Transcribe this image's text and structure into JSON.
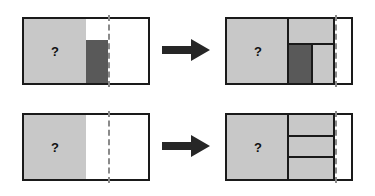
{
  "figure": {
    "background_color": "#ffffff",
    "stroke_color": "#1a1a1a",
    "light_fill": "#c8c8c8",
    "dark_fill": "#595959",
    "dashed_line_color": "#8a8a8a",
    "arrow_color": "#262626",
    "unknown_label": "?",
    "rows": [
      {
        "id": "row-1",
        "left_panel": {
          "id": "panel-top-left",
          "label": "?",
          "blocks": [
            {
              "name": "large-light-block",
              "fill": "light"
            },
            {
              "name": "dark-block",
              "fill": "dark"
            },
            {
              "name": "empty-notch",
              "fill": "white"
            },
            {
              "name": "empty-right-region",
              "fill": "white"
            }
          ],
          "dashed_divider": true
        },
        "arrow": {
          "name": "transform-arrow-top",
          "direction": "right"
        },
        "right_panel": {
          "id": "panel-top-right",
          "label": "?",
          "blocks": [
            {
              "name": "large-light-block",
              "fill": "light"
            },
            {
              "name": "upper-light-block",
              "fill": "light"
            },
            {
              "name": "dark-block",
              "fill": "dark"
            },
            {
              "name": "lower-right-light-block",
              "fill": "light"
            },
            {
              "name": "empty-right-region",
              "fill": "white"
            }
          ],
          "dashed_divider": true
        }
      },
      {
        "id": "row-2",
        "left_panel": {
          "id": "panel-bottom-left",
          "label": "?",
          "blocks": [
            {
              "name": "large-light-block",
              "fill": "light"
            },
            {
              "name": "empty-right-region",
              "fill": "white"
            }
          ],
          "dashed_divider": true
        },
        "arrow": {
          "name": "transform-arrow-bottom",
          "direction": "right"
        },
        "right_panel": {
          "id": "panel-bottom-right",
          "label": "?",
          "blocks": [
            {
              "name": "large-light-block",
              "fill": "light"
            },
            {
              "name": "stacked-light-block-1",
              "fill": "light"
            },
            {
              "name": "stacked-light-block-2",
              "fill": "light"
            },
            {
              "name": "stacked-light-block-3",
              "fill": "light"
            },
            {
              "name": "empty-right-region",
              "fill": "white"
            }
          ],
          "dashed_divider": true
        }
      }
    ]
  }
}
